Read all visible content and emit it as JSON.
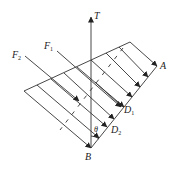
{
  "diagram": {
    "labels": {
      "T": "T",
      "A": "A",
      "B": "B",
      "F1": "F",
      "F1_sub": "1",
      "F2": "F",
      "F2_sub": "2",
      "D1": "D",
      "D1_sub": "1",
      "D2": "D",
      "D2_sub": "2",
      "theta": "θ"
    },
    "colors": {
      "stroke": "#333333",
      "background": "#ffffff"
    },
    "points": {
      "B": [
        91,
        148
      ],
      "A": [
        157,
        66
      ],
      "top_corner": [
        130,
        42
      ],
      "left_corner": [
        24,
        91
      ],
      "T_tip": [
        91,
        17
      ]
    }
  }
}
